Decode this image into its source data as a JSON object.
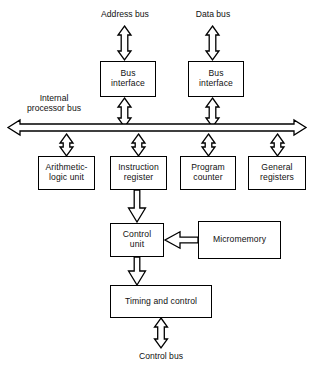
{
  "diagram": {
    "stroke_color": "#000000",
    "fill_color": "#ffffff",
    "text_color": "#111111",
    "labels": {
      "address_bus": "Address bus",
      "data_bus": "Data bus",
      "internal_processor_bus": "Internal\nprocessor bus",
      "control_bus": "Control bus"
    },
    "nodes": [
      {
        "id": "bus-interface-address",
        "label": "Bus\ninterface",
        "x": 100,
        "y": 61,
        "w": 56,
        "h": 36
      },
      {
        "id": "bus-interface-data",
        "label": "Bus\ninterface",
        "x": 188,
        "y": 61,
        "w": 56,
        "h": 36
      },
      {
        "id": "arithmetic-logic-unit",
        "label": "Arithmetic-\nlogic unit",
        "x": 38,
        "y": 156,
        "w": 57,
        "h": 34
      },
      {
        "id": "instruction-register",
        "label": "Instruction\nregister",
        "x": 110,
        "y": 156,
        "w": 57,
        "h": 34
      },
      {
        "id": "program-counter",
        "label": "Program\ncounter",
        "x": 180,
        "y": 156,
        "w": 56,
        "h": 34
      },
      {
        "id": "general-registers",
        "label": "General\nregisters",
        "x": 248,
        "y": 156,
        "w": 58,
        "h": 34
      },
      {
        "id": "control-unit",
        "label": "Control\nunit",
        "x": 110,
        "y": 223,
        "w": 54,
        "h": 34
      },
      {
        "id": "micromemory",
        "label": "Micromemory",
        "x": 198,
        "y": 221,
        "w": 83,
        "h": 38
      },
      {
        "id": "timing-and-control",
        "label": "Timing and control",
        "x": 110,
        "y": 285,
        "w": 102,
        "h": 33
      }
    ],
    "connectors": [
      {
        "id": "address-bus-to-interface",
        "kind": "double-vertical"
      },
      {
        "id": "data-bus-to-interface",
        "kind": "double-vertical"
      },
      {
        "id": "interface-address-to-bus",
        "kind": "double-vertical"
      },
      {
        "id": "interface-data-to-bus",
        "kind": "double-vertical"
      },
      {
        "id": "internal-bus",
        "kind": "double-horizontal"
      },
      {
        "id": "bus-to-alu",
        "kind": "double-vertical"
      },
      {
        "id": "bus-to-instruction-register",
        "kind": "double-vertical"
      },
      {
        "id": "bus-to-program-counter",
        "kind": "double-vertical"
      },
      {
        "id": "bus-to-general-registers",
        "kind": "double-vertical"
      },
      {
        "id": "instruction-register-to-control-unit",
        "kind": "single-down"
      },
      {
        "id": "micromemory-to-control-unit",
        "kind": "single-left"
      },
      {
        "id": "control-unit-to-timing",
        "kind": "single-down"
      },
      {
        "id": "timing-to-control-bus",
        "kind": "double-vertical"
      }
    ]
  }
}
